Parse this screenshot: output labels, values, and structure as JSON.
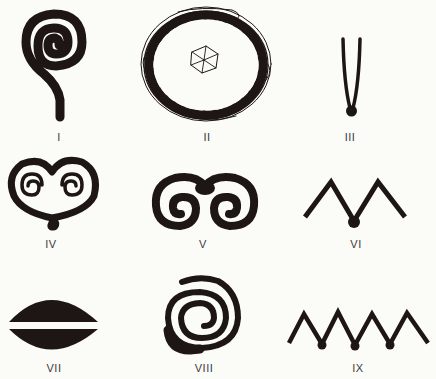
{
  "figure": {
    "ink_color": "#1e1614",
    "background": "#fbfbf8",
    "symbols": [
      {
        "id": "I",
        "label": "I",
        "description": "spiral with stem"
      },
      {
        "id": "II",
        "label": "II",
        "description": "ring of tangled lines with central flower"
      },
      {
        "id": "III",
        "label": "III",
        "description": "V-shaped tongs with knob"
      },
      {
        "id": "IV",
        "label": "IV",
        "description": "heart with twin spirals"
      },
      {
        "id": "V",
        "label": "V",
        "description": "ram horns double spiral"
      },
      {
        "id": "VI",
        "label": "VI",
        "description": "double chevron with knob"
      },
      {
        "id": "VII",
        "label": "VII",
        "description": "split lens / eye shape"
      },
      {
        "id": "VIII",
        "label": "VIII",
        "description": "spiral coil"
      },
      {
        "id": "IX",
        "label": "IX",
        "description": "zigzag with three knobs"
      }
    ]
  }
}
